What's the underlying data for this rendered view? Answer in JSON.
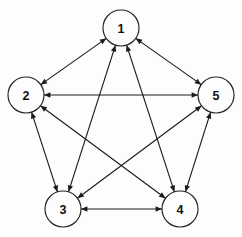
{
  "diagram": {
    "type": "node-link-diagram",
    "background_color": "#fdfdfd",
    "line_color": "#1c1c1c",
    "node_fill": "#fdfdfd",
    "node_stroke": "#222222",
    "label_color": "#111111",
    "node_radius": 18,
    "nodes": [
      {
        "id": "1",
        "label": "1",
        "cx": 121,
        "cy": 28
      },
      {
        "id": "2",
        "label": "2",
        "cx": 26,
        "cy": 95
      },
      {
        "id": "3",
        "label": "3",
        "cx": 63,
        "cy": 209
      },
      {
        "id": "4",
        "label": "4",
        "cx": 180,
        "cy": 209
      },
      {
        "id": "5",
        "label": "5",
        "cx": 216,
        "cy": 95
      }
    ],
    "edges": [
      {
        "from": "1",
        "to": "2",
        "direction": "both"
      },
      {
        "from": "1",
        "to": "3",
        "direction": "both"
      },
      {
        "from": "1",
        "to": "4",
        "direction": "both"
      },
      {
        "from": "1",
        "to": "5",
        "direction": "both"
      },
      {
        "from": "2",
        "to": "3",
        "direction": "both"
      },
      {
        "from": "2",
        "to": "4",
        "direction": "both"
      },
      {
        "from": "2",
        "to": "5",
        "direction": "both"
      },
      {
        "from": "3",
        "to": "4",
        "direction": "both"
      },
      {
        "from": "3",
        "to": "5",
        "direction": "both"
      },
      {
        "from": "4",
        "to": "5",
        "direction": "both"
      }
    ]
  }
}
